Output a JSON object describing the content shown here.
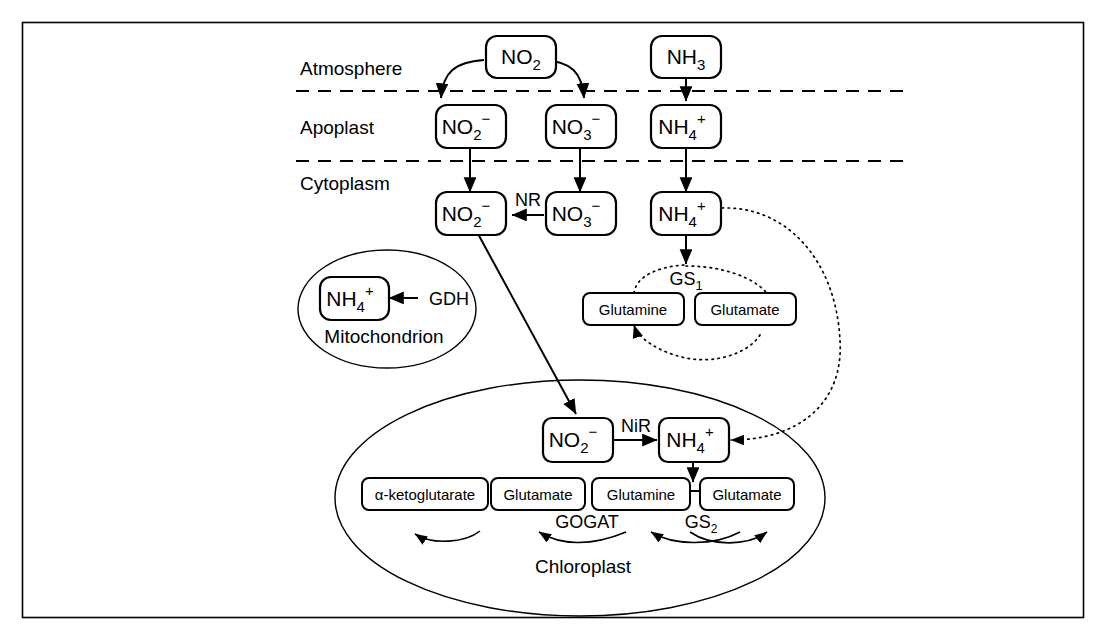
{
  "figure": {
    "border_color": "#000000",
    "background_color": "#ffffff"
  },
  "compartments": [
    {
      "id": "atmosphere",
      "label": "Atmosphere"
    },
    {
      "id": "apoplast",
      "label": "Apoplast"
    },
    {
      "id": "cytoplasm",
      "label": "Cytoplasm"
    }
  ],
  "organelles": [
    {
      "id": "mitochondrion",
      "label": "Mitochondrion"
    },
    {
      "id": "chloroplast",
      "label": "Chloroplast"
    }
  ],
  "nodes": {
    "atm_no2": {
      "base": "NO",
      "sub": "2",
      "sup": ""
    },
    "atm_nh3": {
      "base": "NH",
      "sub": "3",
      "sup": ""
    },
    "apo_no2_minus": {
      "base": "NO",
      "sub": "2",
      "sup": "−"
    },
    "apo_no3_minus": {
      "base": "NO",
      "sub": "3",
      "sup": "−"
    },
    "apo_nh4_plus": {
      "base": "NH",
      "sub": "4",
      "sup": "+"
    },
    "cyt_no2_minus": {
      "base": "NO",
      "sub": "2",
      "sup": "−"
    },
    "cyt_no3_minus": {
      "base": "NO",
      "sub": "3",
      "sup": "−"
    },
    "cyt_nh4_plus": {
      "base": "NH",
      "sub": "4",
      "sup": "+"
    },
    "mito_nh4_plus": {
      "base": "NH",
      "sub": "4",
      "sup": "+"
    },
    "chl_no2_minus": {
      "base": "NO",
      "sub": "2",
      "sup": "−"
    },
    "chl_nh4_plus": {
      "base": "NH",
      "sub": "4",
      "sup": "+"
    },
    "cyt_glutamine": {
      "label": "Glutamine"
    },
    "cyt_glutamate": {
      "label": "Glutamate"
    },
    "chl_ketoglutarate": {
      "label": "α-ketoglutarate"
    },
    "chl_glutamate_1": {
      "label": "Glutamate"
    },
    "chl_glutamine": {
      "label": "Glutamine"
    },
    "chl_glutamate_2": {
      "label": "Glutamate"
    }
  },
  "enzymes": [
    {
      "id": "nr",
      "base": "NR",
      "sub": "",
      "compartment": "cytoplasm"
    },
    {
      "id": "gdh",
      "base": "GDH",
      "sub": "",
      "compartment": "mitochondrion"
    },
    {
      "id": "gs1",
      "base": "GS",
      "sub": "1",
      "compartment": "cytoplasm"
    },
    {
      "id": "nir",
      "base": "NiR",
      "sub": "",
      "compartment": "chloroplast"
    },
    {
      "id": "gogat",
      "base": "GOGAT",
      "sub": "",
      "compartment": "chloroplast"
    },
    {
      "id": "gs2",
      "base": "GS",
      "sub": "2",
      "compartment": "chloroplast"
    }
  ]
}
